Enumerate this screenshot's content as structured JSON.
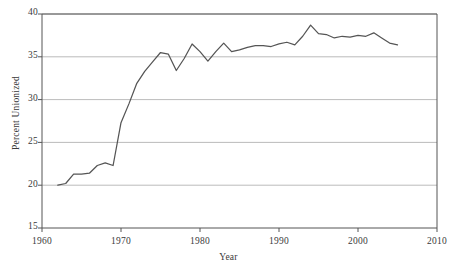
{
  "chart_data": {
    "type": "line",
    "title": "",
    "xlabel": "Year",
    "ylabel": "Percent Unionized",
    "xlim": [
      1960,
      2010
    ],
    "ylim": [
      15,
      40
    ],
    "xticks": [
      1960,
      1970,
      1980,
      1990,
      2000,
      2010
    ],
    "yticks": [
      15,
      20,
      25,
      30,
      35,
      40
    ],
    "grid": "horizontal",
    "legend": "none",
    "line_color": "#555555",
    "axis_color": "#555555",
    "grid_color": "#aaaaaa",
    "background": "#ffffff",
    "series": [
      {
        "name": "Percent Unionized",
        "x": [
          1962,
          1963,
          1964,
          1965,
          1966,
          1967,
          1968,
          1969,
          1970,
          1971,
          1972,
          1973,
          1974,
          1975,
          1976,
          1977,
          1978,
          1979,
          1980,
          1981,
          1982,
          1983,
          1984,
          1985,
          1986,
          1987,
          1988,
          1989,
          1990,
          1991,
          1992,
          1993,
          1994,
          1995,
          1996,
          1997,
          1998,
          1999,
          2000,
          2001,
          2002,
          2003,
          2004,
          2005
        ],
        "values": [
          20.0,
          20.2,
          21.3,
          21.3,
          21.4,
          22.3,
          22.6,
          22.3,
          27.3,
          29.5,
          31.9,
          33.3,
          34.4,
          35.5,
          35.3,
          33.4,
          34.8,
          36.5,
          35.6,
          34.5,
          35.6,
          36.6,
          35.6,
          35.8,
          36.1,
          36.3,
          36.3,
          36.2,
          36.5,
          36.7,
          36.4,
          37.4,
          38.7,
          37.7,
          37.6,
          37.2,
          37.4,
          37.3,
          37.5,
          37.4,
          37.8,
          37.2,
          36.6,
          36.4
        ]
      }
    ]
  },
  "axes": {
    "y_tick_labels": [
      "40",
      "35",
      "30",
      "25",
      "20",
      "15"
    ],
    "x_tick_labels": [
      "1960",
      "1970",
      "1980",
      "1990",
      "2000",
      "2010"
    ],
    "y_axis_title": "Percent Unionized",
    "x_axis_title": "Year"
  }
}
